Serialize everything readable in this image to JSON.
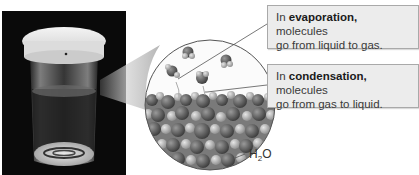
{
  "figure": {
    "photo": {
      "subject": "covered glass containing water",
      "background_color": "#0a0a0a"
    },
    "magnified_view": {
      "label": "H2O",
      "label_main": "H",
      "label_sub": "2",
      "label_tail": "O"
    },
    "callouts": [
      {
        "prefix": "In ",
        "term": "evaporation,",
        "text_line1_rest": " molecules",
        "text_line2": "go from liquid to gas."
      },
      {
        "prefix": "In ",
        "term": "condensation,",
        "text_line1_rest": " molecules",
        "text_line2": "go from gas to liquid."
      }
    ],
    "colors": {
      "callout_fill": "#ececec",
      "callout_border": "#a9a9a9",
      "text": "#3a3a3a",
      "circle_outline": "#555555"
    }
  }
}
